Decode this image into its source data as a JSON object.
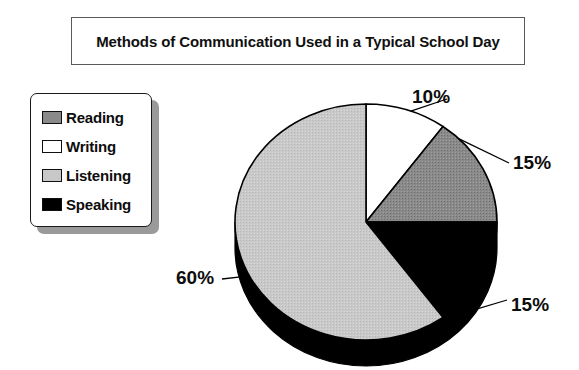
{
  "title": {
    "text": "Methods of Communication Used in a Typical School Day"
  },
  "legend": {
    "items": [
      {
        "label": "Reading",
        "color": "#8a8a8a",
        "swatch": "dark-gray-swatch"
      },
      {
        "label": "Writing",
        "color": "#ffffff",
        "swatch": "white-swatch"
      },
      {
        "label": "Listening",
        "color": "#c8c8c8",
        "swatch": "light-gray-swatch"
      },
      {
        "label": "Speaking",
        "color": "#000000",
        "swatch": "black-swatch"
      }
    ]
  },
  "labels": {
    "writing_pct": "10%",
    "reading_pct": "15%",
    "speaking_pct": "15%",
    "listening_pct": "60%"
  },
  "colors": {
    "reading": "#8a8a8a",
    "writing": "#ffffff",
    "listening": "#c8c8c8",
    "speaking": "#000000",
    "outline": "#000000",
    "depth": "#000000",
    "background": "#ffffff",
    "legend_shadow": "#9a9a9a"
  },
  "chart_data": {
    "type": "pie",
    "title": "Methods of Communication Used in a Typical School Day",
    "categories": [
      "Writing",
      "Reading",
      "Speaking",
      "Listening"
    ],
    "values": [
      10,
      15,
      15,
      60
    ],
    "value_unit": "percent",
    "data_labels": [
      "10%",
      "15%",
      "15%",
      "60%"
    ],
    "slice_colors": [
      "#ffffff",
      "#8a8a8a",
      "#000000",
      "#c8c8c8"
    ],
    "legend_order": [
      "Reading",
      "Writing",
      "Listening",
      "Speaking"
    ],
    "legend_position": "left",
    "start_angle_deg": 0,
    "direction": "clockwise",
    "three_d": true,
    "grid": false,
    "xlabel": "",
    "ylabel": ""
  },
  "geometry": {
    "cx": 366,
    "cy": 222,
    "rx": 131,
    "ry": 118,
    "depth": 26
  }
}
